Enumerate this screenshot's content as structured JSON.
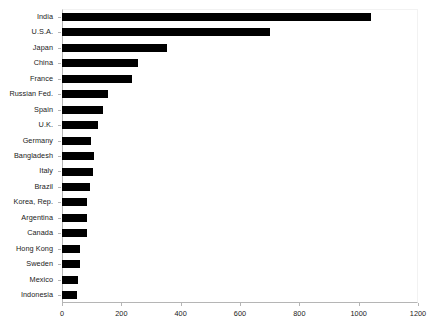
{
  "chart_data": {
    "type": "bar",
    "orientation": "horizontal",
    "title": "",
    "subtitle": "",
    "xlabel": "",
    "ylabel": "",
    "xlim": [
      0,
      1200
    ],
    "ylim": null,
    "grid": false,
    "legend": null,
    "legend_position": "none",
    "bar_color": "#000000",
    "background_color": "#ffffff",
    "axis_color": "#b5b5b5",
    "text_color": "#1a1a1a",
    "xticks": [
      0,
      200,
      400,
      600,
      800,
      1000,
      1200
    ],
    "xtick_labels": [
      "0",
      "200",
      "400",
      "600",
      "800",
      "1000",
      "1200"
    ],
    "categories": [
      "India",
      "U.S.A.",
      "Japan",
      "China",
      "France",
      "Russian Fed.",
      "Spain",
      "U.K.",
      "Germany",
      "Bangladesh",
      "Italy",
      "Brazil",
      "Korea, Rep.",
      "Argentina",
      "Canada",
      "Hong Kong",
      "Sweden",
      "Mexico",
      "Indonesia"
    ],
    "values": [
      1040,
      700,
      354,
      256,
      236,
      155,
      138,
      121,
      98,
      108,
      104,
      94,
      84,
      84,
      84,
      61,
      61,
      54,
      51
    ]
  }
}
